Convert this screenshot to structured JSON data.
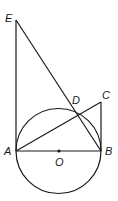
{
  "diagram": {
    "points": {
      "E": {
        "label": "E",
        "x": 16,
        "y": 20
      },
      "A": {
        "label": "A",
        "x": 16,
        "y": 151
      },
      "B": {
        "label": "B",
        "x": 101,
        "y": 151
      },
      "C": {
        "label": "C",
        "x": 101,
        "y": 102
      },
      "D": {
        "label": "D",
        "x": 75,
        "y": 110
      },
      "O": {
        "label": "O",
        "x": 59,
        "y": 151
      }
    },
    "circle": {
      "center": "O",
      "radius": 42.5
    },
    "segments": [
      "EA",
      "EB",
      "AC",
      "CB",
      "AB"
    ],
    "line_color": "#1a1a1a"
  }
}
